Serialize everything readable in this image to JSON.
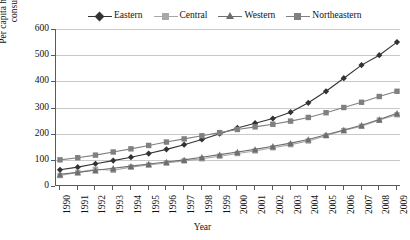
{
  "chart_data": {
    "type": "line",
    "title": "",
    "xlabel": "Year",
    "ylabel": "Per capita household electricity consumption (kWh)",
    "x": [
      1990,
      1991,
      1992,
      1993,
      1994,
      1995,
      1996,
      1997,
      1998,
      1999,
      2000,
      2001,
      2002,
      2003,
      2004,
      2005,
      2006,
      2007,
      2008,
      2009
    ],
    "xtick_labels": [
      "1990",
      "1991",
      "1992",
      "1993",
      "1994",
      "1995",
      "1996",
      "1997",
      "1998",
      "1999",
      "2000",
      "2001",
      "2002",
      "2003",
      "2004",
      "2005",
      "2006",
      "2007",
      "2008",
      "2009"
    ],
    "ytick_labels": [
      "0",
      "100",
      "200",
      "300",
      "400",
      "500",
      "600"
    ],
    "yticks": [
      0,
      100,
      200,
      300,
      400,
      500,
      600
    ],
    "ylim": [
      0,
      600
    ],
    "xlim": [
      1990,
      2009
    ],
    "grid": "horizontal",
    "legend_position": "top",
    "series": [
      {
        "name": "Eastern",
        "marker": "diamond",
        "color": "#333333",
        "values": [
          62,
          72,
          85,
          97,
          110,
          124,
          140,
          158,
          178,
          200,
          222,
          240,
          258,
          282,
          318,
          362,
          412,
          462,
          500,
          550
        ]
      },
      {
        "name": "Central",
        "marker": "square",
        "color": "#a8a8a8",
        "values": [
          40,
          52,
          64,
          60,
          72,
          80,
          88,
          96,
          104,
          114,
          124,
          134,
          146,
          158,
          172,
          192,
          212,
          228,
          252,
          272
        ]
      },
      {
        "name": "Western",
        "marker": "triangle",
        "color": "#6e6e6e",
        "values": [
          45,
          52,
          60,
          68,
          76,
          84,
          92,
          100,
          110,
          120,
          130,
          140,
          152,
          164,
          178,
          196,
          214,
          232,
          254,
          278
        ]
      },
      {
        "name": "Northeastern",
        "marker": "square",
        "color": "#808080",
        "values": [
          100,
          108,
          118,
          130,
          142,
          155,
          168,
          180,
          192,
          204,
          216,
          226,
          236,
          248,
          262,
          280,
          300,
          320,
          342,
          362
        ]
      }
    ]
  },
  "legend": {
    "items": [
      {
        "label": "Eastern"
      },
      {
        "label": "Central"
      },
      {
        "label": "Western"
      },
      {
        "label": "Northeastern"
      }
    ]
  },
  "axes": {
    "x_title": "Year",
    "y_title": "Per capita household electricity consumption (kWh)"
  }
}
